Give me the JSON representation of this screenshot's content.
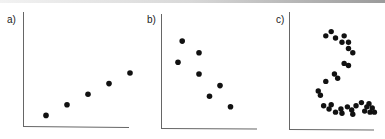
{
  "chart_data": [
    {
      "type": "scatter",
      "title": "a)",
      "xlabel": "",
      "ylabel": "",
      "grid": false,
      "description": "positive linear relationship",
      "points": [
        [
          1,
          1
        ],
        [
          2,
          2
        ],
        [
          3,
          3
        ],
        [
          4,
          4
        ],
        [
          5,
          5
        ]
      ]
    },
    {
      "type": "scatter",
      "title": "b)",
      "xlabel": "",
      "ylabel": "",
      "grid": false,
      "description": "negative relationship with scatter",
      "points": [
        [
          1.2,
          8.2
        ],
        [
          1,
          6.2
        ],
        [
          2,
          7.1
        ],
        [
          2,
          5.1
        ],
        [
          3,
          4
        ],
        [
          2.5,
          3
        ],
        [
          3.5,
          2
        ]
      ]
    },
    {
      "type": "scatter",
      "title": "c)",
      "xlabel": "",
      "ylabel": "",
      "grid": false,
      "description": "non-linear, S/2-shaped pattern",
      "points": [
        [
          3.5,
          8.6
        ],
        [
          4,
          9
        ],
        [
          4.4,
          8.4
        ],
        [
          5.2,
          8.6
        ],
        [
          5,
          8
        ],
        [
          5.6,
          8
        ],
        [
          5.6,
          7.4
        ],
        [
          6,
          7
        ],
        [
          5.2,
          6
        ],
        [
          5.6,
          5.8
        ],
        [
          4.3,
          5
        ],
        [
          4.6,
          4.6
        ],
        [
          3.5,
          4.3
        ],
        [
          2.8,
          3.4
        ],
        [
          3,
          3
        ],
        [
          3.3,
          2
        ],
        [
          4,
          2.1
        ],
        [
          3.8,
          1.7
        ],
        [
          4.4,
          1.4
        ],
        [
          4.9,
          1.7
        ],
        [
          5,
          1.3
        ],
        [
          5.5,
          1.9
        ],
        [
          5.9,
          1.6
        ],
        [
          6,
          1.2
        ],
        [
          6.3,
          2
        ],
        [
          6.8,
          2.3
        ],
        [
          7.3,
          1.9
        ],
        [
          7.1,
          1.5
        ],
        [
          7.5,
          2.2
        ],
        [
          7.6,
          1.4
        ],
        [
          7.8,
          1.8
        ],
        [
          8,
          1.4
        ]
      ]
    }
  ],
  "labels": {
    "a": "a)",
    "b": "b)",
    "c": "c)"
  }
}
